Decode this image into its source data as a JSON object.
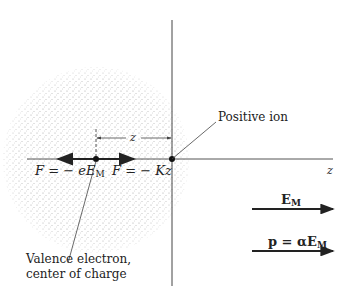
{
  "figure": {
    "labels": {
      "force_electric": "F = − eE",
      "force_electric_sub": "M",
      "force_restoring": "F = − Kz",
      "displacement": "z",
      "axis": "z",
      "positive_ion": "Positive ion",
      "valence_line1": "Valence electron,",
      "valence_line2": "center of charge",
      "field": "E",
      "field_sub": "M",
      "dipole": "p = αE",
      "dipole_sub": "M"
    },
    "colors": {
      "ink": "#222222",
      "stipple": "#9a9a9a"
    }
  }
}
